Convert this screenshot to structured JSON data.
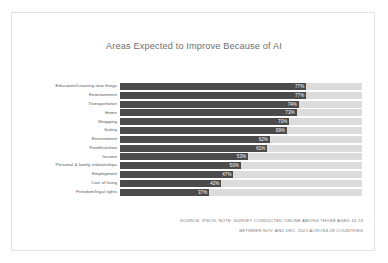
{
  "chart_data": {
    "type": "bar",
    "orientation": "horizontal",
    "title": "Areas Expected to Improve Because of AI",
    "subtitle": "",
    "xlabel": "",
    "ylabel": "",
    "xlim": [
      0,
      100
    ],
    "grid": false,
    "legend": null,
    "value_suffix": "%",
    "categories": [
      "Education/Learning new things",
      "Entertainment",
      "Transportation",
      "Home",
      "Shopping",
      "Safety",
      "Environment",
      "Food/nutrition",
      "Income",
      "Personal & family relationships",
      "Employment",
      "Cost of living",
      "Freedom/legal rights"
    ],
    "values": [
      77,
      77,
      74,
      73,
      70,
      69,
      62,
      61,
      53,
      50,
      47,
      42,
      37
    ],
    "data_labels": [
      "77%",
      "77%",
      "74%",
      "73%",
      "70%",
      "69%",
      "62%",
      "61%",
      "53%",
      "50%",
      "47%",
      "42%",
      "37%"
    ],
    "bars": [
      {
        "label": "Education/Learning new things",
        "value": 77,
        "data_label": "77%"
      },
      {
        "label": "Entertainment",
        "value": 77,
        "data_label": "77%"
      },
      {
        "label": "Transportation",
        "value": 74,
        "data_label": "74%"
      },
      {
        "label": "Home",
        "value": 73,
        "data_label": "73%"
      },
      {
        "label": "Shopping",
        "value": 70,
        "data_label": "70%"
      },
      {
        "label": "Safety",
        "value": 69,
        "data_label": "69%"
      },
      {
        "label": "Environment",
        "value": 62,
        "data_label": "62%"
      },
      {
        "label": "Food/nutrition",
        "value": 61,
        "data_label": "61%"
      },
      {
        "label": "Income",
        "value": 53,
        "data_label": "53%"
      },
      {
        "label": "Personal & family relationships",
        "value": 50,
        "data_label": "50%"
      },
      {
        "label": "Employment",
        "value": 47,
        "data_label": "47%"
      },
      {
        "label": "Cost of living",
        "value": 42,
        "data_label": "42%"
      },
      {
        "label": "Freedom/legal rights",
        "value": 37,
        "data_label": "37%"
      }
    ],
    "colors": {
      "bar_fill": "#4b4b4b",
      "bar_track": "#dcdcdc",
      "title_text": "#6f6f6f",
      "category_text": "#555555",
      "value_text": "#ffffff",
      "note_text": "#7a7a7a",
      "card_background": "#ffffff",
      "card_border": "#e2e2e2"
    }
  },
  "notes": {
    "line1": "SOURCE: IPSOS; NOTE: SURVEY CONDUCTED ONLINE AMONG THOSE AGED 16-74",
    "line2": "BETWEEN NOV. AND DEC. 2021 ACROSS 28 COUNTRIES"
  }
}
